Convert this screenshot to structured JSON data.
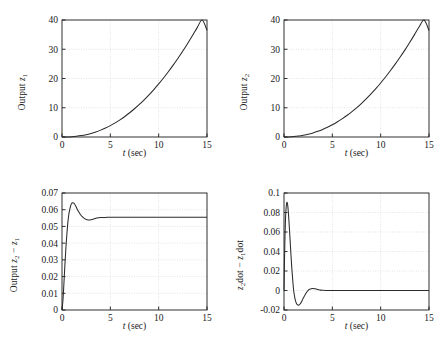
{
  "figure": {
    "title": "",
    "panel_count": 4,
    "background": "#ffffff",
    "line_color": "#2b2b2b",
    "grid_color": "#c8c8c8",
    "axis_color": "#1a1a1a"
  },
  "chart_data": [
    {
      "id": "panel-1",
      "type": "line",
      "title": "",
      "xlabel": "t (sec)",
      "ylabel": "Output z1",
      "ylabel_parts": {
        "prefix": "Output ",
        "symbol": "z",
        "subscript": "1"
      },
      "xlim": [
        0,
        15
      ],
      "ylim": [
        0,
        40
      ],
      "xticks": [
        0,
        5,
        10,
        15
      ],
      "yticks": [
        0,
        10,
        20,
        30,
        40
      ],
      "xticklabels": [
        "0",
        "5",
        "10",
        "15"
      ],
      "yticklabels": [
        "0",
        "10",
        "20",
        "30",
        "40"
      ],
      "grid": true,
      "legend": null,
      "series": [
        {
          "name": "z1",
          "x": [
            0,
            0.5,
            1,
            1.5,
            2,
            2.5,
            3,
            3.5,
            4,
            4.5,
            5,
            5.5,
            6,
            6.5,
            7,
            7.5,
            8,
            8.5,
            9,
            9.5,
            10,
            10.5,
            11,
            11.5,
            12,
            12.5,
            13,
            13.5,
            14,
            14.5,
            15
          ],
          "y": [
            0,
            0.02,
            0.1,
            0.25,
            0.48,
            0.8,
            1.22,
            1.73,
            2.35,
            3.07,
            3.9,
            4.83,
            5.87,
            7.02,
            8.28,
            9.65,
            11.13,
            12.72,
            14.42,
            16.23,
            18.15,
            20.18,
            22.32,
            24.57,
            26.93,
            29.4,
            31.98,
            34.67,
            37.47,
            40.38,
            36.5
          ]
        }
      ]
    },
    {
      "id": "panel-2",
      "type": "line",
      "title": "",
      "xlabel": "t (sec)",
      "ylabel": "Output z2",
      "ylabel_parts": {
        "prefix": "Output ",
        "symbol": "z",
        "subscript": "2"
      },
      "xlim": [
        0,
        15
      ],
      "ylim": [
        0,
        40
      ],
      "xticks": [
        0,
        5,
        10,
        15
      ],
      "yticks": [
        0,
        10,
        20,
        30,
        40
      ],
      "xticklabels": [
        "0",
        "5",
        "10",
        "15"
      ],
      "yticklabels": [
        "0",
        "10",
        "20",
        "30",
        "40"
      ],
      "grid": true,
      "legend": null,
      "series": [
        {
          "name": "z2",
          "x": [
            0,
            0.5,
            1,
            1.5,
            2,
            2.5,
            3,
            3.5,
            4,
            4.5,
            5,
            5.5,
            6,
            6.5,
            7,
            7.5,
            8,
            8.5,
            9,
            9.5,
            10,
            10.5,
            11,
            11.5,
            12,
            12.5,
            13,
            13.5,
            14,
            14.5,
            15
          ],
          "y": [
            0,
            0.03,
            0.14,
            0.33,
            0.6,
            0.95,
            1.4,
            1.95,
            2.6,
            3.35,
            4.2,
            5.15,
            6.2,
            7.35,
            8.6,
            9.98,
            11.45,
            13.05,
            14.75,
            16.55,
            18.45,
            20.5,
            22.65,
            24.9,
            27.25,
            29.7,
            32.3,
            35.0,
            37.8,
            40.7,
            36.4
          ]
        }
      ]
    },
    {
      "id": "panel-3",
      "type": "line",
      "title": "",
      "xlabel": "t (sec)",
      "ylabel": "Output z2 - z1",
      "ylabel_parts": {
        "prefix": "Output ",
        "symbol_a": "z",
        "sub_a": "2",
        "minus": " − ",
        "symbol_b": "z",
        "sub_b": "1"
      },
      "xlim": [
        0,
        15
      ],
      "ylim": [
        0,
        0.07
      ],
      "xticks": [
        0,
        5,
        10,
        15
      ],
      "yticks": [
        0,
        0.01,
        0.02,
        0.03,
        0.04,
        0.05,
        0.06,
        0.07
      ],
      "xticklabels": [
        "0",
        "5",
        "10",
        "15"
      ],
      "yticklabels": [
        "0",
        "0.01",
        "0.02",
        "0.03",
        "0.04",
        "0.05",
        "0.06",
        "0.07"
      ],
      "grid": true,
      "legend": null,
      "series": [
        {
          "name": "z2 - z1",
          "x": [
            0,
            0.1,
            0.2,
            0.3,
            0.4,
            0.5,
            0.6,
            0.7,
            0.8,
            0.9,
            1.0,
            1.1,
            1.2,
            1.3,
            1.4,
            1.5,
            1.7,
            1.9,
            2.1,
            2.3,
            2.5,
            2.7,
            3.0,
            3.3,
            3.6,
            4.0,
            4.5,
            5.0,
            6.0,
            8.0,
            10.0,
            12.0,
            15.0
          ],
          "y": [
            0.0,
            0.006,
            0.016,
            0.027,
            0.037,
            0.045,
            0.052,
            0.057,
            0.06,
            0.0625,
            0.0637,
            0.0641,
            0.064,
            0.0634,
            0.0624,
            0.0612,
            0.059,
            0.0571,
            0.0558,
            0.0548,
            0.0542,
            0.0539,
            0.054,
            0.0545,
            0.055,
            0.0553,
            0.0554,
            0.0555,
            0.0555,
            0.0555,
            0.0555,
            0.0555,
            0.0555
          ]
        }
      ]
    },
    {
      "id": "panel-4",
      "type": "line",
      "title": "",
      "xlabel": "t (sec)",
      "ylabel": "z2dot - z1dot",
      "ylabel_parts": {
        "symbol_a": "z",
        "sub_a": "2",
        "word_a": "dot",
        "minus": " − ",
        "symbol_b": "z",
        "sub_b": "1",
        "word_b": "dot"
      },
      "xlim": [
        0,
        15
      ],
      "ylim": [
        -0.02,
        0.1
      ],
      "xticks": [
        0,
        5,
        10,
        15
      ],
      "yticks": [
        -0.02,
        0,
        0.02,
        0.04,
        0.06,
        0.08,
        0.1
      ],
      "xticklabels": [
        "0",
        "5",
        "10",
        "15"
      ],
      "yticklabels": [
        "-0.02",
        "0",
        "0.02",
        "0.04",
        "0.06",
        "0.08",
        "0.1"
      ],
      "grid": true,
      "legend": null,
      "series": [
        {
          "name": "z2dot - z1dot",
          "x": [
            0,
            0.05,
            0.1,
            0.15,
            0.2,
            0.25,
            0.3,
            0.35,
            0.4,
            0.45,
            0.5,
            0.6,
            0.7,
            0.8,
            0.9,
            1.0,
            1.1,
            1.2,
            1.3,
            1.4,
            1.5,
            1.6,
            1.7,
            1.8,
            1.9,
            2.0,
            2.2,
            2.4,
            2.6,
            2.8,
            3.0,
            3.2,
            3.4,
            3.6,
            3.8,
            4.0,
            4.3,
            4.6,
            5.0,
            6.0,
            8.0,
            10.0,
            12.0,
            15.0
          ],
          "y": [
            0.0,
            0.03,
            0.055,
            0.072,
            0.082,
            0.088,
            0.0905,
            0.0895,
            0.086,
            0.08,
            0.073,
            0.057,
            0.04,
            0.024,
            0.011,
            0.0,
            -0.0065,
            -0.011,
            -0.0135,
            -0.0148,
            -0.015,
            -0.0145,
            -0.0133,
            -0.0117,
            -0.0098,
            -0.0078,
            -0.004,
            -0.001,
            0.001,
            0.0019,
            0.0021,
            0.0018,
            0.0013,
            0.0008,
            0.0004,
            0.0002,
            0.0,
            0.0,
            0.0,
            0.0,
            0.0,
            0.0,
            0.0,
            0.0
          ]
        }
      ]
    }
  ]
}
